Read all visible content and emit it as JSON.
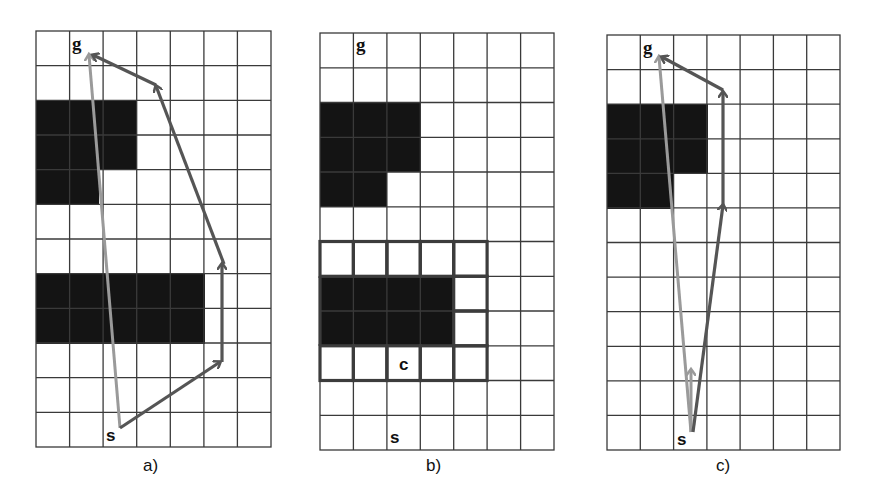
{
  "figure": {
    "colors": {
      "grid_line": "#3a3a3a",
      "obstacle": "#141414",
      "path_light": "#9a9a9a",
      "path_dark": "#555555",
      "highlight_border": "#3c3c3c",
      "background": "#ffffff"
    },
    "panels": [
      {
        "id": "a",
        "caption": "a)",
        "cols": 7,
        "rows": 12,
        "start_label": "s",
        "goal_label": "g"
      },
      {
        "id": "b",
        "caption": "b)",
        "cols": 7,
        "rows": 12,
        "start_label": "s",
        "goal_label": "g",
        "corner_label": "c"
      },
      {
        "id": "c",
        "caption": "c)",
        "cols": 7,
        "rows": 12,
        "start_label": "s",
        "goal_label": "g"
      }
    ]
  }
}
